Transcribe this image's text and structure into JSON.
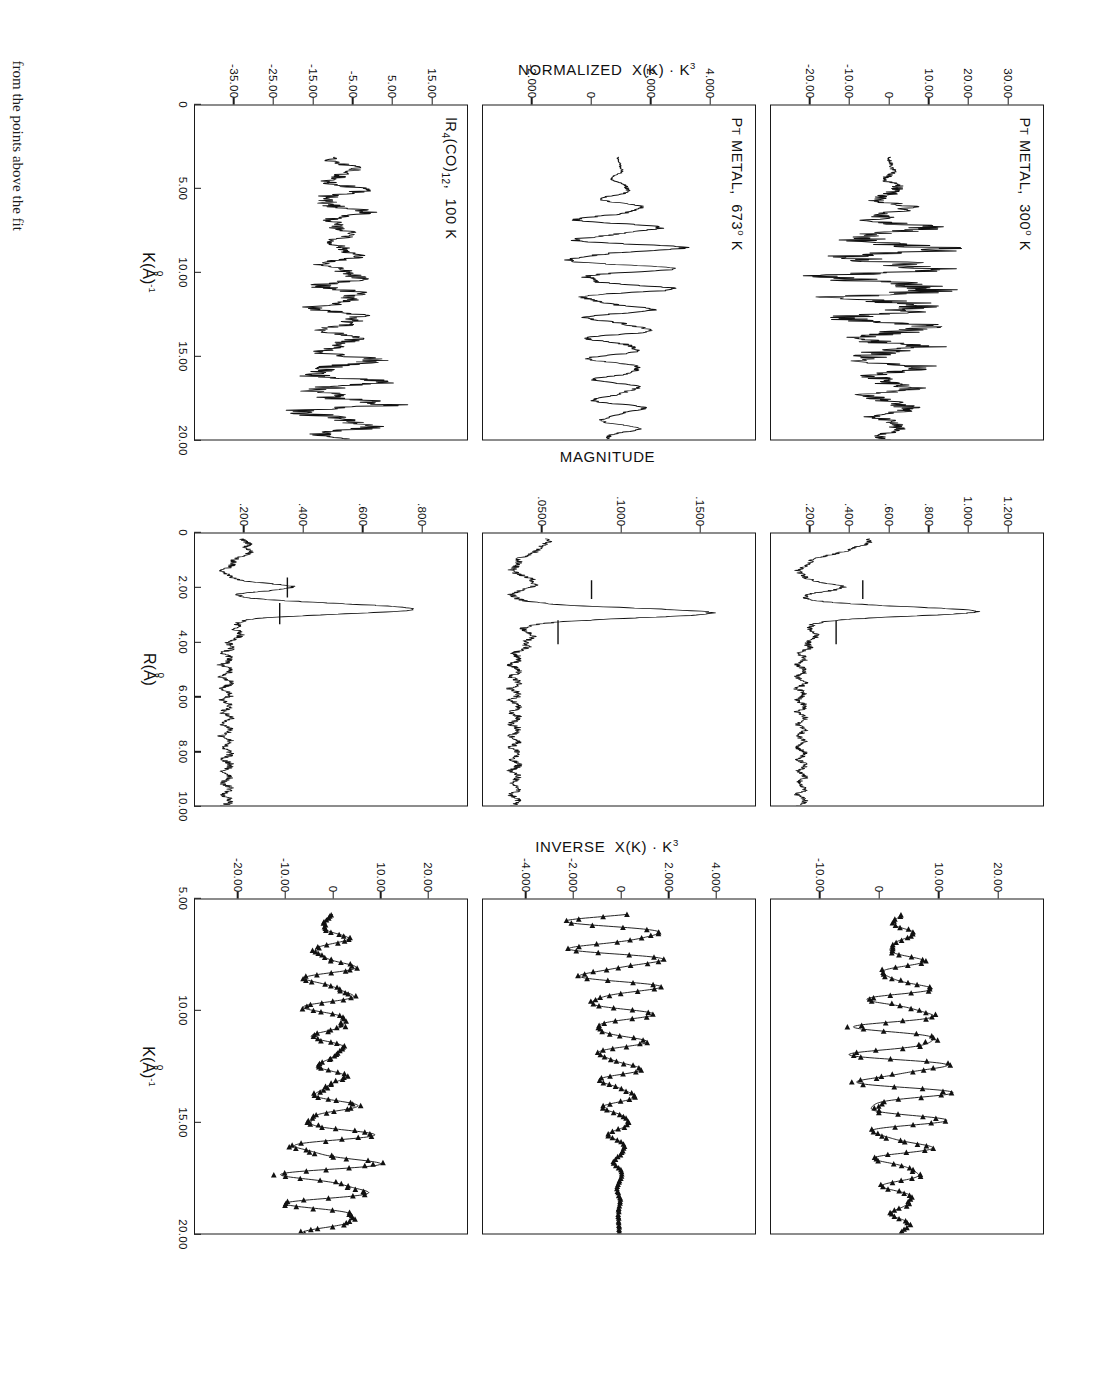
{
  "figure": {
    "caption": "from the points above the fit",
    "rotation_deg": 90
  },
  "columns": [
    {
      "id": "normalized",
      "y_axis_title": "NORMALIZED  X(K)·K³",
      "x_axis_title": "K(Å)⁻¹",
      "x_ticks": [
        "0",
        "5.00",
        "10.00",
        "15.00",
        "20.00"
      ],
      "panels": [
        {
          "label_main": "Pᴛ METAL,  300° K",
          "y_ticks": [
            "30.00",
            "20.00",
            "10.00",
            "0",
            "-10.00",
            "-20.00"
          ]
        },
        {
          "label_main": "Pᴛ METAL,  673° K",
          "y_ticks": [
            "4.000",
            "2.000",
            "0",
            "-2.000"
          ]
        },
        {
          "label_main": "lR₄(CO)₁₂,  100 K",
          "y_ticks": [
            "15.00",
            "5.00",
            "-5.00",
            "-15.00",
            "-25.00",
            "-35.00"
          ]
        }
      ]
    },
    {
      "id": "magnitude",
      "y_axis_title": "MAGNITUDE",
      "x_axis_title": "R(Å)",
      "x_ticks": [
        "0",
        "2.00",
        "4.00",
        "6.00",
        "8.00",
        "10.00"
      ],
      "panels": [
        {
          "label_main": "",
          "y_ticks": [
            "1.200",
            "1.000",
            ".800",
            ".600",
            ".400",
            ".200"
          ]
        },
        {
          "label_main": "",
          "y_ticks": [
            ".1500",
            ".1000",
            ".0500"
          ]
        },
        {
          "label_main": "",
          "y_ticks": [
            ".800",
            ".600",
            ".400",
            ".200"
          ]
        }
      ]
    },
    {
      "id": "inverse",
      "y_axis_title": "INVERSE  X(K)·K³",
      "x_axis_title": "K(Å)⁻¹",
      "x_ticks": [
        "5.00",
        "10.00",
        "15.00",
        "20.00"
      ],
      "panels": [
        {
          "label_main": "",
          "y_ticks": [
            "20.00",
            "10.00",
            "0",
            "-10.00"
          ]
        },
        {
          "label_main": "",
          "y_ticks": [
            "4.000",
            "2.000",
            "0",
            "-2.000",
            "-4.000"
          ]
        },
        {
          "label_main": "",
          "y_ticks": [
            "20.00",
            "10.00",
            "0",
            "-10.00",
            "-20.00"
          ]
        }
      ]
    }
  ],
  "chart_data": {
    "type": "line",
    "panels": [
      {
        "row": 1,
        "column": "normalized",
        "sample": "Pᴛ METAL,  300° K",
        "xlabel": "K(Å)⁻¹",
        "ylabel": "NORMALIZED  X(K)·K³",
        "xlim": [
          0,
          20.0
        ],
        "ylim": [
          -27.0,
          33.0
        ],
        "grid": false,
        "xticks": [
          0,
          5.0,
          10.0,
          15.0,
          20.0
        ],
        "yticks": [
          30.0,
          20.0,
          10.0,
          0,
          -10.0,
          -20.0
        ],
        "series": [
          {
            "name": "chi(k)k^3 data",
            "x": [
              3.0,
              3.4,
              3.8,
              4.2,
              4.6,
              5.0,
              5.4,
              5.8,
              6.2,
              6.6,
              7.0,
              7.4,
              7.8,
              8.2,
              8.6,
              9.0,
              9.4,
              9.8,
              10.2,
              10.6,
              11.0,
              11.4,
              11.8,
              12.2,
              12.6,
              13.0,
              13.4,
              13.8,
              14.2,
              14.6,
              15.0,
              15.4,
              15.8,
              16.2,
              16.6,
              17.0,
              17.4,
              17.8,
              18.2,
              18.6,
              19.0,
              19.4,
              19.8,
              20.0
            ],
            "y": [
              -2.0,
              -5.0,
              -7.5,
              -6.0,
              -3.0,
              -4.5,
              -7.0,
              -3.0,
              6.0,
              17.0,
              5.0,
              -9.0,
              -13.0,
              -2.0,
              14.0,
              21.0,
              8.0,
              -11.0,
              -16.0,
              -5.0,
              10.0,
              16.0,
              4.0,
              -10.0,
              -13.0,
              -2.0,
              11.0,
              15.0,
              3.0,
              -10.0,
              -12.0,
              0.0,
              10.0,
              9.0,
              -2.0,
              -8.0,
              -6.0,
              2.0,
              7.0,
              4.0,
              -4.0,
              -6.0,
              -1.0,
              2.0
            ]
          }
        ]
      },
      {
        "row": 2,
        "column": "normalized",
        "sample": "Pᴛ METAL,  673° K",
        "xlabel": "K(Å)⁻¹",
        "ylabel": "NORMALIZED  X(K)·K³",
        "xlim": [
          0,
          20.0
        ],
        "ylim": [
          -3.6,
          5.0
        ],
        "grid": false,
        "xticks": [
          0,
          5.0,
          10.0,
          15.0,
          20.0
        ],
        "yticks": [
          4.0,
          2.0,
          0,
          -2.0
        ],
        "series": [
          {
            "name": "chi(k)k^3 data",
            "x": [
              3.0,
              3.6,
              4.2,
              4.8,
              5.4,
              6.0,
              6.6,
              7.2,
              7.8,
              8.4,
              9.0,
              9.6,
              10.2,
              10.8,
              11.4,
              12.0,
              12.6,
              13.2,
              13.8,
              14.4,
              15.0,
              15.6,
              16.2,
              16.8,
              17.4,
              18.0,
              18.6,
              19.2,
              19.8,
              20.0
            ],
            "y": [
              -0.4,
              -1.3,
              -2.6,
              -1.2,
              0.6,
              -0.8,
              -2.2,
              0.4,
              3.8,
              0.8,
              -2.3,
              -2.0,
              1.6,
              2.6,
              0.1,
              -1.9,
              -1.4,
              1.2,
              1.8,
              0.0,
              -1.6,
              -1.0,
              0.9,
              1.3,
              -0.2,
              -1.0,
              -0.6,
              0.7,
              1.6,
              0.8
            ]
          }
        ]
      },
      {
        "row": 3,
        "column": "normalized",
        "sample": "lR₄(CO)₁₂,  100 K",
        "xlabel": "K(Å)⁻¹",
        "ylabel": "NORMALIZED  X(K)·K³",
        "xlim": [
          0,
          20.0
        ],
        "ylim": [
          -40.0,
          20.0
        ],
        "grid": false,
        "xticks": [
          0,
          5.0,
          10.0,
          15.0,
          20.0
        ],
        "yticks": [
          15.0,
          5.0,
          -5.0,
          -15.0,
          -25.0,
          -35.0
        ],
        "series": [
          {
            "name": "chi(k)k^3 data",
            "x": [
              3.0,
              3.6,
              4.2,
              4.8,
              5.4,
              6.0,
              6.6,
              7.2,
              7.8,
              8.4,
              9.0,
              9.6,
              10.2,
              10.8,
              11.4,
              12.0,
              12.6,
              13.2,
              13.8,
              14.4,
              15.0,
              15.6,
              16.2,
              16.8,
              17.4,
              18.0,
              18.6,
              19.2,
              19.8,
              20.0
            ],
            "y": [
              -3.0,
              -8.0,
              -11.0,
              -9.0,
              -2.0,
              3.0,
              1.0,
              -6.0,
              -5.0,
              3.0,
              8.0,
              2.0,
              -7.0,
              -6.0,
              6.0,
              11.0,
              1.0,
              -9.0,
              -5.0,
              9.0,
              13.0,
              0.0,
              -11.0,
              -6.0,
              8.0,
              15.0,
              2.0,
              -10.0,
              -4.0,
              4.0
            ]
          }
        ]
      },
      {
        "row": 1,
        "column": "magnitude",
        "xlabel": "R(Å)",
        "ylabel": "MAGNITUDE",
        "xlim": [
          0,
          10.0
        ],
        "ylim": [
          0,
          1.3
        ],
        "grid": false,
        "xticks": [
          0,
          2.0,
          4.0,
          6.0,
          8.0,
          10.0
        ],
        "yticks": [
          1.2,
          1.0,
          0.8,
          0.6,
          0.4,
          0.2
        ],
        "annotations": [
          "window bar 1.6-2.2 A",
          "window bar 3.1-3.9 A"
        ],
        "series": [
          {
            "name": "FT magnitude",
            "x": [
              0.0,
              0.2,
              0.4,
              0.6,
              0.8,
              1.0,
              1.2,
              1.4,
              1.6,
              1.8,
              2.0,
              2.2,
              2.4,
              2.6,
              2.8,
              3.0,
              3.2,
              3.4,
              3.6,
              3.8,
              4.0,
              4.4,
              4.8,
              5.2,
              5.6,
              6.0,
              6.4,
              6.8,
              7.2,
              7.6,
              8.0,
              8.4,
              8.8,
              9.2,
              9.6,
              10.0
            ],
            "y": [
              0.43,
              0.42,
              0.36,
              0.22,
              0.12,
              0.08,
              0.06,
              0.1,
              0.22,
              0.34,
              0.26,
              0.12,
              0.3,
              0.7,
              1.02,
              0.62,
              0.24,
              0.15,
              0.17,
              0.22,
              0.16,
              0.12,
              0.18,
              0.14,
              0.16,
              0.13,
              0.15,
              0.12,
              0.14,
              0.11,
              0.13,
              0.12,
              0.15,
              0.13,
              0.16,
              0.12
            ]
          }
        ]
      },
      {
        "row": 2,
        "column": "magnitude",
        "xlabel": "R(Å)",
        "ylabel": "MAGNITUDE",
        "xlim": [
          0,
          10.0
        ],
        "ylim": [
          0,
          0.175
        ],
        "grid": false,
        "xticks": [
          0,
          2.0,
          4.0,
          6.0,
          8.0,
          10.0
        ],
        "yticks": [
          0.15,
          0.1,
          0.05
        ],
        "annotations": [
          "window bar 1.6-2.2 A",
          "window bar 3.1-3.9 A"
        ],
        "series": [
          {
            "name": "FT magnitude",
            "x": [
              0.0,
              0.2,
              0.4,
              0.6,
              0.8,
              1.0,
              1.2,
              1.4,
              1.6,
              1.8,
              2.0,
              2.2,
              2.4,
              2.6,
              2.8,
              3.0,
              3.2,
              3.6,
              4.0,
              4.4,
              4.8,
              5.2,
              5.6,
              6.0,
              6.4,
              6.8,
              7.2,
              7.6,
              8.0,
              8.4,
              8.8,
              9.2,
              9.6,
              10.0
            ],
            "y": [
              0.03,
              0.032,
              0.028,
              0.02,
              0.014,
              0.016,
              0.022,
              0.028,
              0.03,
              0.022,
              0.016,
              0.024,
              0.048,
              0.1,
              0.148,
              0.086,
              0.03,
              0.018,
              0.022,
              0.016,
              0.02,
              0.014,
              0.018,
              0.015,
              0.017,
              0.013,
              0.016,
              0.012,
              0.015,
              0.013,
              0.016,
              0.012,
              0.017,
              0.013
            ]
          }
        ]
      },
      {
        "row": 3,
        "column": "magnitude",
        "xlabel": "R(Å)",
        "ylabel": "MAGNITUDE",
        "xlim": [
          0,
          10.0
        ],
        "ylim": [
          0,
          0.95
        ],
        "grid": false,
        "xticks": [
          0,
          2.0,
          4.0,
          6.0,
          8.0,
          10.0
        ],
        "yticks": [
          0.8,
          0.6,
          0.4,
          0.2
        ],
        "annotations": [
          "window bar 1.5-2.2 A",
          "window bar 2.4-3.2 A"
        ],
        "series": [
          {
            "name": "FT magnitude",
            "x": [
              0.0,
              0.2,
              0.4,
              0.6,
              0.8,
              1.0,
              1.2,
              1.4,
              1.6,
              1.8,
              2.0,
              2.2,
              2.4,
              2.6,
              2.8,
              3.0,
              3.2,
              3.6,
              4.0,
              4.4,
              4.8,
              5.2,
              5.6,
              6.0,
              6.4,
              6.8,
              7.2,
              7.6,
              8.0,
              8.4,
              8.8,
              9.2,
              9.6,
              10.0
            ],
            "y": [
              0.1,
              0.12,
              0.16,
              0.12,
              0.06,
              0.1,
              0.16,
              0.1,
              0.18,
              0.3,
              0.2,
              0.34,
              0.72,
              0.86,
              0.52,
              0.22,
              0.12,
              0.14,
              0.1,
              0.12,
              0.09,
              0.11,
              0.08,
              0.1,
              0.07,
              0.09,
              0.08,
              0.1,
              0.07,
              0.09,
              0.08,
              0.1,
              0.09,
              0.11
            ]
          }
        ]
      },
      {
        "row": 1,
        "column": "inverse",
        "xlabel": "K(Å)⁻¹",
        "ylabel": "INVERSE  X(K)·K³",
        "xlim": [
          5.0,
          20.0
        ],
        "ylim": [
          -15.0,
          23.0
        ],
        "grid": false,
        "xticks": [
          5.0,
          10.0,
          15.0,
          20.0
        ],
        "yticks": [
          20.0,
          10.0,
          0,
          -10.0
        ],
        "series": [
          {
            "name": "inverse transform (fit)",
            "style": "solid"
          },
          {
            "name": "data points",
            "style": "triangle-markers"
          }
        ]
      },
      {
        "row": 2,
        "column": "inverse",
        "xlabel": "K(Å)⁻¹",
        "ylabel": "INVERSE  X(K)·K³",
        "xlim": [
          5.0,
          20.0
        ],
        "ylim": [
          -5.2,
          5.2
        ],
        "grid": false,
        "xticks": [
          5.0,
          10.0,
          15.0,
          20.0
        ],
        "yticks": [
          4.0,
          2.0,
          0,
          -2.0,
          -4.0
        ],
        "series": [
          {
            "name": "inverse transform (fit)",
            "style": "solid"
          },
          {
            "name": "data points",
            "style": "triangle-markers"
          }
        ]
      },
      {
        "row": 3,
        "column": "inverse",
        "xlabel": "K(Å)⁻¹",
        "ylabel": "INVERSE  X(K)·K³",
        "xlim": [
          5.0,
          20.0
        ],
        "ylim": [
          -23.0,
          23.0
        ],
        "grid": false,
        "xticks": [
          5.0,
          10.0,
          15.0,
          20.0
        ],
        "yticks": [
          20.0,
          10.0,
          0,
          -10.0,
          -20.0
        ],
        "series": [
          {
            "name": "inverse transform (fit)",
            "style": "solid"
          },
          {
            "name": "data points",
            "style": "triangle-markers"
          }
        ]
      }
    ]
  }
}
